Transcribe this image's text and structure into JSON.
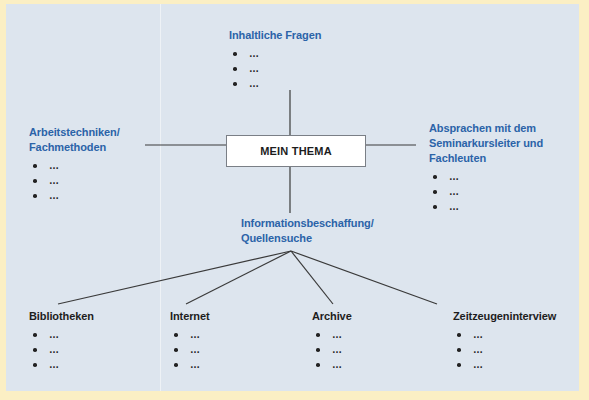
{
  "colors": {
    "background": "#fbefc4",
    "panel": "#dde5ee",
    "heading_blue": "#2b63a8",
    "heading_black": "#1d1d1d",
    "line": "#3a3a3a",
    "center_box_fill": "#ffffff"
  },
  "center": {
    "label": "MEIN THEMA"
  },
  "top": {
    "title": "Inhaltliche Fragen",
    "items": [
      "…",
      "…",
      "…"
    ]
  },
  "left": {
    "title_line1": "Arbeitstechniken/",
    "title_line2": "Fachmethoden",
    "items": [
      "…",
      "…",
      "…"
    ]
  },
  "right": {
    "title_line1": "Absprachen mit dem",
    "title_line2": "Seminarkursleiter und",
    "title_line3": "Fachleuten",
    "items": [
      "…",
      "…",
      "…"
    ]
  },
  "bottom": {
    "title_line1": "Informationsbeschaffung/",
    "title_line2": "Quellensuche"
  },
  "sources": [
    {
      "title": "Bibliotheken",
      "items": [
        "…",
        "…",
        "…"
      ]
    },
    {
      "title": "Internet",
      "items": [
        "…",
        "…",
        "…"
      ]
    },
    {
      "title": "Archive",
      "items": [
        "…",
        "…",
        "…"
      ]
    },
    {
      "title": "Zeitzeugeninterview",
      "items": [
        "…",
        "…",
        "…"
      ]
    }
  ]
}
